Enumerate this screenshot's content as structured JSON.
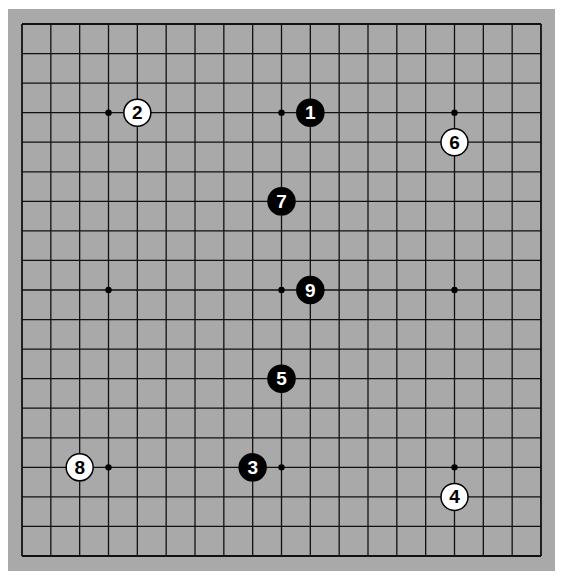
{
  "board": {
    "size": 19,
    "background_color": "#a9a9a9",
    "line_color": "#111111",
    "star_points": [
      [
        3,
        3
      ],
      [
        9,
        3
      ],
      [
        15,
        3
      ],
      [
        3,
        9
      ],
      [
        9,
        9
      ],
      [
        15,
        9
      ],
      [
        3,
        15
      ],
      [
        9,
        15
      ],
      [
        15,
        15
      ]
    ]
  },
  "stones": [
    {
      "move": "1",
      "color": "black",
      "col": 10,
      "row": 3
    },
    {
      "move": "2",
      "color": "white",
      "col": 4,
      "row": 3
    },
    {
      "move": "3",
      "color": "black",
      "col": 8,
      "row": 15
    },
    {
      "move": "4",
      "color": "white",
      "col": 15,
      "row": 16
    },
    {
      "move": "5",
      "color": "black",
      "col": 9,
      "row": 12
    },
    {
      "move": "6",
      "color": "white",
      "col": 15,
      "row": 4
    },
    {
      "move": "7",
      "color": "black",
      "col": 9,
      "row": 6
    },
    {
      "move": "8",
      "color": "white",
      "col": 2,
      "row": 15
    },
    {
      "move": "9",
      "color": "black",
      "col": 10,
      "row": 9
    }
  ]
}
